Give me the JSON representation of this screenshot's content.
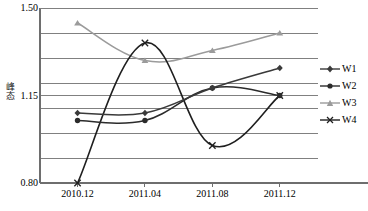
{
  "chart_data": {
    "type": "line",
    "title": "",
    "subtitle": "",
    "xlabel": "",
    "ylabel": "峰态",
    "categories": [
      "2010.12",
      "2011.04",
      "2011.08",
      "2011.12"
    ],
    "x_tick_labels": [
      "2010.12",
      "2011.04",
      "2011.08",
      "2011.12"
    ],
    "y_tick_labels": [
      "1.50",
      "1.15",
      "0.80"
    ],
    "ylim": [
      0.8,
      1.5
    ],
    "y_gridline_values": [
      1.5,
      1.4,
      1.3,
      1.2,
      1.15,
      1.1,
      1.0,
      0.9,
      0.8
    ],
    "grid": true,
    "legend_position": "right",
    "smoothed": true,
    "series": [
      {
        "name": "W1",
        "marker": "diamond",
        "color": "#3a3a3a",
        "values": [
          1.08,
          1.08,
          1.18,
          1.26
        ]
      },
      {
        "name": "W2",
        "marker": "circle",
        "color": "#2b2b2b",
        "values": [
          1.05,
          1.05,
          1.18,
          1.15
        ]
      },
      {
        "name": "W3",
        "marker": "triangle",
        "color": "#9b9b9b",
        "values": [
          1.44,
          1.29,
          1.33,
          1.4
        ]
      },
      {
        "name": "W4",
        "marker": "cross",
        "color": "#1f1f1f",
        "values": [
          0.8,
          1.36,
          0.95,
          1.15
        ]
      }
    ]
  },
  "axis": {
    "y_title": "峰态",
    "y_labels": [
      {
        "text": "1.50",
        "value": 1.5
      },
      {
        "text": "1.15",
        "value": 1.15
      },
      {
        "text": "0.80",
        "value": 0.8
      }
    ],
    "x_labels": [
      {
        "text": "2010.12"
      },
      {
        "text": "2011.04"
      },
      {
        "text": "2011.08"
      },
      {
        "text": "2011.12"
      }
    ]
  },
  "legend": {
    "items": [
      {
        "label": "W1",
        "marker": "diamond-marker-icon",
        "color": "#3a3a3a"
      },
      {
        "label": "W2",
        "marker": "circle-marker-icon",
        "color": "#2b2b2b"
      },
      {
        "label": "W3",
        "marker": "triangle-marker-icon",
        "color": "#9b9b9b"
      },
      {
        "label": "W4",
        "marker": "cross-marker-icon",
        "color": "#1f1f1f"
      }
    ]
  },
  "colors": {
    "axis": "#6e6e6e",
    "grid": "#808080",
    "background": "#ffffff",
    "text": "#000000"
  }
}
